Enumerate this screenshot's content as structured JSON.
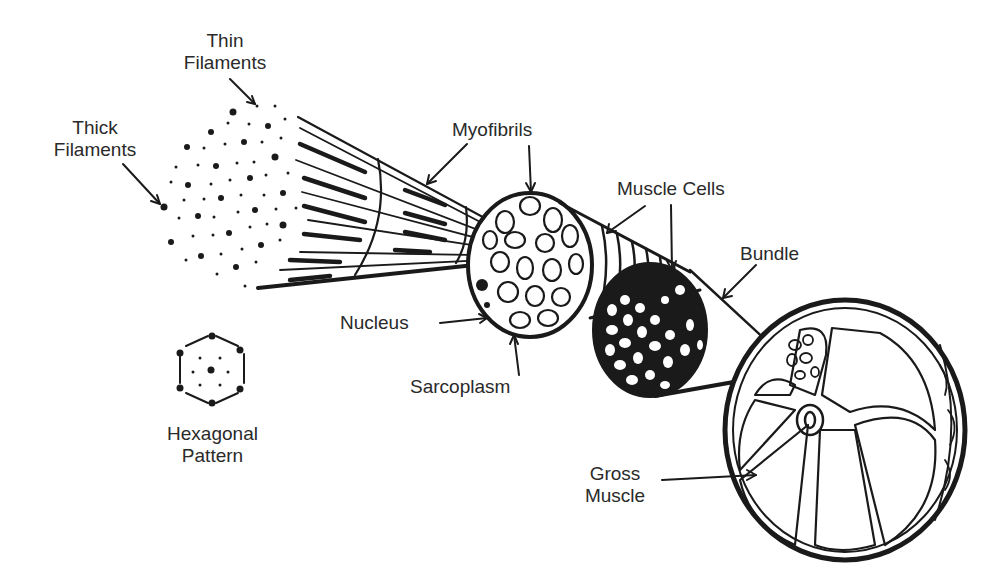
{
  "diagram": {
    "colors": {
      "ink": "#1a1a1a",
      "background": "#ffffff",
      "text": "#2a2a2a"
    },
    "labels": {
      "thin_filaments": [
        "Thin",
        "Filaments"
      ],
      "thick_filaments": [
        "Thick",
        "Filaments"
      ],
      "myofibrils": "Myofibrils",
      "muscle_cells": "Muscle Cells",
      "bundle": "Bundle",
      "nucleus": "Nucleus",
      "sarcoplasm": "Sarcoplasm",
      "hexagonal_pattern": [
        "Hexagonal",
        "Pattern"
      ],
      "gross_muscle": [
        "Gross",
        "Muscle"
      ]
    }
  }
}
